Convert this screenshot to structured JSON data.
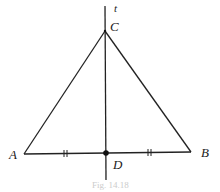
{
  "figure": {
    "labels": {
      "line": "t",
      "top_vertex": "C",
      "left_vertex": "A",
      "right_vertex": "B",
      "midpoint": "D"
    },
    "caption": "Fig. 14.18",
    "colors": {
      "stroke": "#222222",
      "background": "#ffffff"
    }
  }
}
